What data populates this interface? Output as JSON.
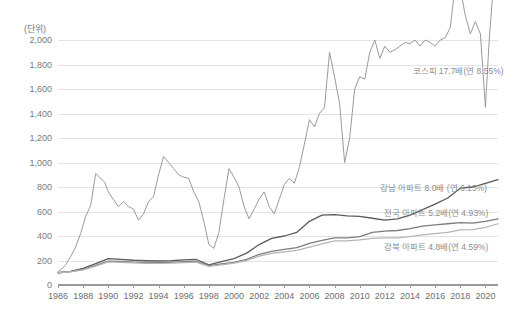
{
  "unit_label": "(단위)",
  "chart_data": {
    "type": "line",
    "title": "",
    "subtitle": "",
    "xlabel": "",
    "ylabel": "(단위)",
    "grid": true,
    "legend_position": "inline-annotations",
    "xlim": [
      1986,
      2021
    ],
    "ylim": [
      0,
      2000
    ],
    "ytick_labels": [
      "0",
      "200",
      "400",
      "600",
      "800",
      "1,000",
      "1,200",
      "1,400",
      "1,600",
      "1,800",
      "2,000"
    ],
    "ytick_values": [
      0,
      200,
      400,
      600,
      800,
      1000,
      1200,
      1400,
      1600,
      1800,
      2000
    ],
    "xtick_labels": [
      "1986",
      "1988",
      "1990",
      "1992",
      "1994",
      "1996",
      "1998",
      "2000",
      "2002",
      "2004",
      "2006",
      "2008",
      "2010",
      "2012",
      "2014",
      "2016",
      "2018",
      "2020"
    ],
    "xtick_values": [
      1986,
      1988,
      1990,
      1992,
      1994,
      1996,
      1998,
      2000,
      2002,
      2004,
      2006,
      2008,
      2010,
      2012,
      2014,
      2016,
      2018,
      2020
    ],
    "annotations": [
      {
        "text": "코스피 17.7배(연 8.55%)",
        "x": 2014.2,
        "y": 1755,
        "color": "#8d8d8d"
      },
      {
        "text": "강남 아파트 8.0배 (연 6.13%)",
        "x": 2011.6,
        "y": 800,
        "color": "#8d8d8d"
      },
      {
        "text": "전국 아파트 5.2배(연 4.93%)",
        "x": 2011.9,
        "y": 600,
        "color": "#8d8d8d"
      },
      {
        "text": "강북 아파트 4.8배(연 4.59%)",
        "x": 2011.9,
        "y": 320,
        "color": "#8d8d8d"
      }
    ],
    "series": [
      {
        "name": "코스피 17.7배(연 8.55%)",
        "color": "#9a9a9a",
        "width": 1.0,
        "x": [
          1986.0,
          1986.3,
          1986.6,
          1987.0,
          1987.4,
          1987.8,
          1988.2,
          1988.6,
          1989.0,
          1989.3,
          1989.7,
          1990.0,
          1990.4,
          1990.8,
          1991.2,
          1991.6,
          1992.0,
          1992.4,
          1992.8,
          1993.2,
          1993.6,
          1994.0,
          1994.4,
          1994.8,
          1995.2,
          1995.6,
          1996.0,
          1996.4,
          1996.8,
          1997.2,
          1997.6,
          1998.0,
          1998.4,
          1998.8,
          1999.2,
          1999.6,
          2000.0,
          2000.4,
          2000.8,
          2001.2,
          2001.6,
          2002.0,
          2002.4,
          2002.8,
          2003.2,
          2003.6,
          2004.0,
          2004.4,
          2004.8,
          2005.2,
          2005.6,
          2006.0,
          2006.4,
          2006.8,
          2007.2,
          2007.6,
          2008.0,
          2008.4,
          2008.8,
          2009.2,
          2009.6,
          2010.0,
          2010.4,
          2010.8,
          2011.2,
          2011.6,
          2012.0,
          2012.4,
          2012.8,
          2013.2,
          2013.6,
          2014.0,
          2014.4,
          2014.8,
          2015.2,
          2015.6,
          2016.0,
          2016.4,
          2016.8,
          2017.2,
          2017.6,
          2018.0,
          2018.4,
          2018.8,
          2019.2,
          2019.6,
          2020.0,
          2020.3,
          2020.6,
          2020.9,
          2021.0
        ],
        "y": [
          110,
          130,
          165,
          230,
          310,
          420,
          560,
          650,
          910,
          880,
          840,
          760,
          700,
          640,
          680,
          640,
          620,
          530,
          580,
          680,
          720,
          900,
          1050,
          1000,
          950,
          900,
          880,
          870,
          760,
          680,
          520,
          330,
          300,
          430,
          700,
          950,
          880,
          800,
          640,
          540,
          620,
          700,
          760,
          640,
          580,
          700,
          820,
          870,
          830,
          960,
          1150,
          1350,
          1290,
          1400,
          1450,
          1900,
          1700,
          1480,
          1000,
          1200,
          1600,
          1700,
          1680,
          1900,
          2000,
          1850,
          1950,
          1900,
          1920,
          1950,
          1980,
          1970,
          2000,
          1950,
          2000,
          1980,
          1950,
          2000,
          2020,
          2100,
          2450,
          2420,
          2200,
          2050,
          2150,
          2050,
          1450,
          2000,
          2400,
          2800,
          3000
        ]
      },
      {
        "name": "강남 아파트 8.0배 (연 6.13%)",
        "color": "#5a5a5a",
        "width": 1.3,
        "x": [
          1986,
          1987,
          1988,
          1989,
          1990,
          1991,
          1992,
          1993,
          1994,
          1995,
          1996,
          1997,
          1998,
          1999,
          2000,
          2001,
          2002,
          2003,
          2004,
          2005,
          2006,
          2007,
          2008,
          2009,
          2010,
          2011,
          2012,
          2013,
          2014,
          2015,
          2016,
          2017,
          2018,
          2019,
          2020,
          2021
        ],
        "y": [
          100,
          112,
          135,
          175,
          215,
          210,
          202,
          198,
          196,
          198,
          205,
          208,
          165,
          190,
          215,
          260,
          330,
          380,
          400,
          430,
          520,
          570,
          575,
          565,
          560,
          545,
          530,
          540,
          570,
          615,
          660,
          710,
          790,
          800,
          830,
          860
        ]
      },
      {
        "name": "전국 아파트 5.2배(연 4.93%)",
        "color": "#7d7d7d",
        "width": 1.3,
        "x": [
          1986,
          1987,
          1988,
          1989,
          1990,
          1991,
          1992,
          1993,
          1994,
          1995,
          1996,
          1997,
          1998,
          1999,
          2000,
          2001,
          2002,
          2003,
          2004,
          2005,
          2006,
          2007,
          2008,
          2009,
          2010,
          2011,
          2012,
          2013,
          2014,
          2015,
          2016,
          2017,
          2018,
          2019,
          2020,
          2021
        ],
        "y": [
          100,
          110,
          128,
          160,
          195,
          192,
          186,
          183,
          182,
          184,
          190,
          193,
          158,
          172,
          185,
          210,
          250,
          275,
          290,
          305,
          340,
          365,
          385,
          385,
          395,
          430,
          440,
          445,
          460,
          480,
          490,
          500,
          510,
          505,
          520,
          540
        ]
      },
      {
        "name": "강북 아파트 4.8배(연 4.59%)",
        "color": "#b5b5b5",
        "width": 1.3,
        "x": [
          1986,
          1987,
          1988,
          1989,
          1990,
          1991,
          1992,
          1993,
          1994,
          1995,
          1996,
          1997,
          1998,
          1999,
          2000,
          2001,
          2002,
          2003,
          2004,
          2005,
          2006,
          2007,
          2008,
          2009,
          2010,
          2011,
          2012,
          2013,
          2014,
          2015,
          2016,
          2017,
          2018,
          2019,
          2020,
          2021
        ],
        "y": [
          100,
          108,
          124,
          155,
          188,
          185,
          180,
          177,
          176,
          178,
          183,
          186,
          152,
          165,
          178,
          200,
          235,
          258,
          270,
          282,
          310,
          335,
          360,
          360,
          368,
          380,
          385,
          385,
          395,
          410,
          420,
          430,
          450,
          452,
          470,
          500
        ]
      }
    ]
  }
}
